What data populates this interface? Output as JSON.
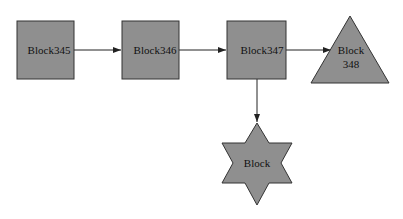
{
  "diagram": {
    "colors": {
      "fill": "#8f8f8f",
      "stroke": "#333333",
      "edge": "#222222"
    },
    "nodes": [
      {
        "id": "n345",
        "shape": "square",
        "label": "Block345"
      },
      {
        "id": "n346",
        "shape": "square",
        "label": "Block346"
      },
      {
        "id": "n347",
        "shape": "square",
        "label": "Block347"
      },
      {
        "id": "n348",
        "shape": "triangle",
        "label_line1": "Block",
        "label_line2": "348"
      },
      {
        "id": "nstar",
        "shape": "star",
        "label": "Block"
      }
    ],
    "edges": [
      {
        "from": "n345",
        "to": "n346"
      },
      {
        "from": "n346",
        "to": "n347"
      },
      {
        "from": "n347",
        "to": "n348"
      },
      {
        "from": "n347",
        "to": "nstar"
      }
    ]
  }
}
